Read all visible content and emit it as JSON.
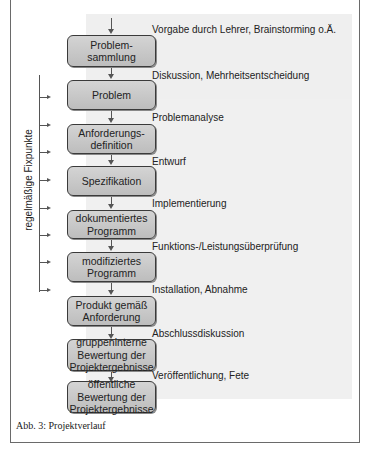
{
  "diagram": {
    "steps": [
      {
        "lines": [
          "Problem-",
          "sammlung"
        ]
      },
      {
        "lines": [
          "Problem"
        ]
      },
      {
        "lines": [
          "Anforderungs-",
          "definition"
        ]
      },
      {
        "lines": [
          "Spezifikation"
        ]
      },
      {
        "lines": [
          "dokumentiertes",
          "Programm"
        ]
      },
      {
        "lines": [
          "modifiziertes",
          "Programm"
        ]
      },
      {
        "lines": [
          "Produkt gemäß",
          "Anforderung"
        ]
      },
      {
        "lines": [
          "gruppeninterne",
          "Bewertung der",
          "Projektergebnisse"
        ]
      },
      {
        "lines": [
          "öffentliche",
          "Bewertung der",
          "Projektergebnisse"
        ]
      }
    ],
    "transitions": [
      "Vorgabe durch Lehrer, Brainstorming o.Ä.",
      "Diskussion, Mehrheitsentscheidung",
      "Problemanalyse",
      "Entwurf",
      "Implementierung",
      "Funktions-/Leistungsüberprüfung",
      "Installation, Abnahme",
      "Abschlussdiskussion",
      "Veröffentlichung, Fete"
    ],
    "side_label": "regelmäßige Fixpunkte",
    "caption": "Abb. 3: Projektverlauf"
  }
}
